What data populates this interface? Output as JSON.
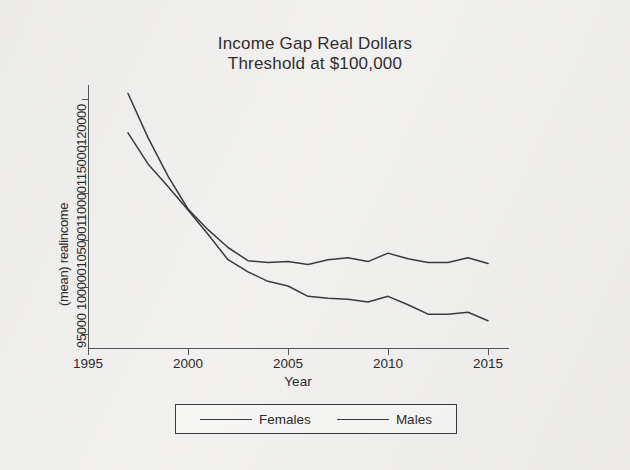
{
  "chart_data": {
    "type": "line",
    "title": "Income Gap Real Dollars",
    "subtitle": "Threshold at $100,000",
    "xlabel": "Year",
    "ylabel": "(mean) realincome",
    "xlim": [
      1995,
      2016
    ],
    "ylim": [
      93500,
      121500
    ],
    "xticks": [
      1995,
      2000,
      2005,
      2010,
      2015
    ],
    "xtick_labels": [
      "1995",
      "2000",
      "2005",
      "2010",
      "2015"
    ],
    "yticks": [
      95000,
      100000,
      105000,
      110000,
      115000,
      120000
    ],
    "ytick_labels": [
      "95000",
      "100000",
      "105000",
      "110000",
      "115000",
      "120000"
    ],
    "ytick_labels_joined": "95000 100000105000110000115000120000",
    "grid": false,
    "legend_position": "bottom",
    "x": [
      1997,
      1998,
      1999,
      2000,
      2001,
      2002,
      2003,
      2004,
      2005,
      2006,
      2007,
      2008,
      2009,
      2010,
      2011,
      2012,
      2013,
      2014,
      2015
    ],
    "series": [
      {
        "name": "Females",
        "color": "#3b3b3b",
        "values": [
          116400,
          113100,
          110700,
          108200,
          105600,
          102900,
          101600,
          100600,
          100100,
          99000,
          98800,
          98700,
          98400,
          99000,
          98100,
          97100,
          97100,
          97300,
          96400
        ]
      },
      {
        "name": "Males",
        "color": "#3b3b3b",
        "values": [
          120600,
          115900,
          111800,
          108300,
          106100,
          104200,
          102800,
          102600,
          102700,
          102400,
          102900,
          103100,
          102700,
          103600,
          103000,
          102600,
          102600,
          103100,
          102500
        ]
      }
    ]
  },
  "legend": {
    "items": [
      {
        "label": "Females"
      },
      {
        "label": "Males"
      }
    ]
  }
}
